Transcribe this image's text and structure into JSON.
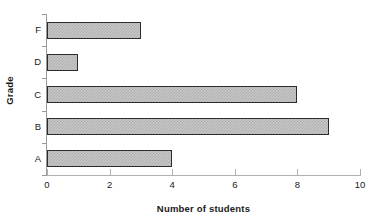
{
  "chart_data": {
    "type": "bar",
    "orientation": "horizontal",
    "title": "",
    "xlabel": "Number of students",
    "ylabel": "Grade",
    "categories": [
      "A",
      "B",
      "C",
      "D",
      "F"
    ],
    "values": [
      4,
      9,
      8,
      1,
      3
    ],
    "display_order_top_to_bottom": [
      "F",
      "D",
      "C",
      "B",
      "A"
    ],
    "xlim": [
      0,
      10
    ],
    "xticks": [
      0,
      2,
      4,
      6,
      8,
      10
    ],
    "xtick_labels": [
      "0",
      "2",
      "4",
      "6",
      "8",
      "10"
    ],
    "grid": false,
    "legend": null,
    "bar_fill_color": "#c8c8c8",
    "bar_pattern_color": "#adadad",
    "bar_border_color": "#2b2b2b",
    "axis_color": "#9a9a9a",
    "background_color": "#ffffff"
  },
  "axes": {
    "x_title": "Number of students",
    "y_title": "Grade"
  },
  "bars": [
    {
      "category": "F",
      "value": 3,
      "label": "F"
    },
    {
      "category": "D",
      "value": 1,
      "label": "D"
    },
    {
      "category": "C",
      "value": 8,
      "label": "C"
    },
    {
      "category": "B",
      "value": 9,
      "label": "B"
    },
    {
      "category": "A",
      "value": 4,
      "label": "A"
    }
  ],
  "xticks": [
    {
      "value": 0,
      "label": "0"
    },
    {
      "value": 2,
      "label": "2"
    },
    {
      "value": 4,
      "label": "4"
    },
    {
      "value": 6,
      "label": "6"
    },
    {
      "value": 8,
      "label": "8"
    },
    {
      "value": 10,
      "label": "10"
    }
  ]
}
